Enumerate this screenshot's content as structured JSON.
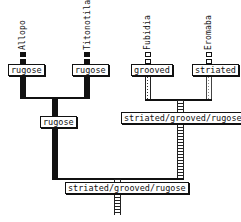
{
  "diagram": {
    "type": "phylogenetic-character-tree",
    "taxa": [
      {
        "name": "Allopo",
        "state": "rugose",
        "pattern": "solid"
      },
      {
        "name": "Titonotila",
        "state": "rugose",
        "pattern": "solid"
      },
      {
        "name": "Fubidia",
        "state": "grooved",
        "pattern": "dotted"
      },
      {
        "name": "Eromaba",
        "state": "striated",
        "pattern": "light-dotted"
      }
    ],
    "internal_nodes": {
      "left_clade": {
        "state": "rugose",
        "pattern": "solid"
      },
      "right_clade": {
        "state": "striated/grooved/rugose",
        "pattern": "ladder"
      },
      "root": {
        "state": "striated/grooved/rugose",
        "pattern": "ladder"
      }
    }
  }
}
